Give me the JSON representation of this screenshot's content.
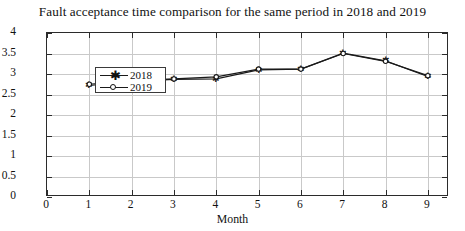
{
  "chart_data": {
    "type": "line",
    "title": "Fault acceptance time comparison for the same period in 2018 and 2019",
    "xlabel": "Month",
    "ylabel": "Time(minutes)",
    "xlim": [
      0,
      9.5
    ],
    "ylim": [
      0,
      4
    ],
    "x": [
      1,
      2,
      3,
      4,
      5,
      6,
      7,
      8,
      9
    ],
    "xticks": [
      "0",
      "1",
      "2",
      "3",
      "4",
      "5",
      "6",
      "7",
      "8",
      "9"
    ],
    "xtick_values": [
      0,
      1,
      2,
      3,
      4,
      5,
      6,
      7,
      8,
      9
    ],
    "yticks": [
      "0",
      "0.5",
      "1",
      "1.5",
      "2",
      "2.5",
      "3",
      "3.5",
      "4"
    ],
    "ytick_values": [
      0,
      0.5,
      1,
      1.5,
      2,
      2.5,
      3,
      3.5,
      4
    ],
    "grid": true,
    "legend_position": "upper left",
    "series": [
      {
        "name": "2018",
        "marker": "star",
        "color": "#1a1a1a",
        "values": [
          2.72,
          2.82,
          2.87,
          2.88,
          3.1,
          3.12,
          3.51,
          3.32,
          2.94
        ]
      },
      {
        "name": "2019",
        "marker": "circle",
        "color": "#1a1a1a",
        "values": [
          2.75,
          2.84,
          2.88,
          2.93,
          3.12,
          3.12,
          3.5,
          3.31,
          2.96
        ]
      }
    ]
  }
}
